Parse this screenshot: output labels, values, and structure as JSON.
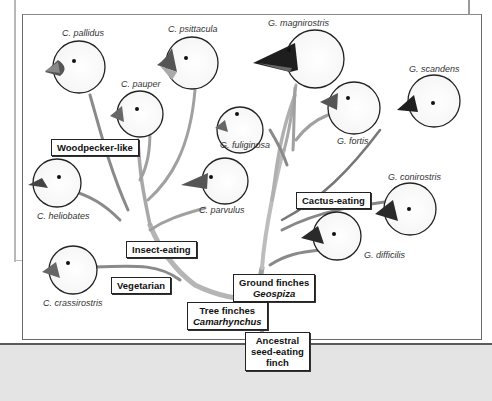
{
  "diagram": {
    "root": {
      "line1": "Ancestral",
      "line2": "seed-eating",
      "line3": "finch"
    },
    "groups": {
      "tree_finches": {
        "line1": "Tree finches",
        "line2": "Camarhynchus"
      },
      "ground_finches": {
        "line1": "Ground finches",
        "line2": "Geospiza"
      }
    },
    "diet_labels": {
      "woodpecker": "Woodpecker-like",
      "insect": "Insect-eating",
      "vegetarian": "Vegetarian",
      "cactus": "Cactus-eating"
    },
    "species": {
      "c_pallidus": "C. pallidus",
      "c_psittacula": "C. psittacula",
      "c_pauper": "C. pauper",
      "c_heliobates": "C. heliobates",
      "c_parvulus": "C. parvulus",
      "c_crassirostris": "C. crassirostris",
      "g_magnirostris": "G. magnirostris",
      "g_scandens": "G. scandens",
      "g_fuliginosa": "G. fuliginosa",
      "g_fortis": "G. fortis",
      "g_conirostris": "G. conirostris",
      "g_difficilis": "G. difficilis"
    },
    "colors": {
      "branch": "#8f8f8f",
      "branch_light": "#c9c9c9",
      "frame": "#6a6a6a",
      "beak_dark": "#2a2a2a",
      "beak_light": "#7a7a7a"
    }
  }
}
